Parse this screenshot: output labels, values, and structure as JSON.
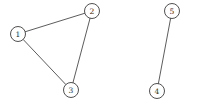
{
  "figure": {
    "background_color": "#ffffff",
    "width": 198,
    "height": 104
  },
  "style": {
    "node_fill": "#ffffff",
    "node_stroke": "#3c3c3c",
    "node_radius": 7.5,
    "node_stroke_width": 0.9,
    "edge_color": "#4a4a4a",
    "edge_width": 0.9,
    "label_color": "#2b2b2b"
  },
  "chart_data": {
    "type": "diagram",
    "graph_type": "undirected",
    "title": "",
    "node_count": 5,
    "edge_count": 4,
    "components": 2,
    "nodes": [
      {
        "id": "1",
        "label": "1",
        "x": 18,
        "y": 34
      },
      {
        "id": "2",
        "label": "2",
        "x": 92,
        "y": 11
      },
      {
        "id": "3",
        "label": "3",
        "x": 71,
        "y": 90
      },
      {
        "id": "4",
        "label": "4",
        "x": 157,
        "y": 91
      },
      {
        "id": "5",
        "label": "5",
        "x": 172,
        "y": 11
      }
    ],
    "edges": [
      {
        "source": "1",
        "target": "2"
      },
      {
        "source": "1",
        "target": "3"
      },
      {
        "source": "2",
        "target": "3"
      },
      {
        "source": "4",
        "target": "5"
      }
    ]
  }
}
